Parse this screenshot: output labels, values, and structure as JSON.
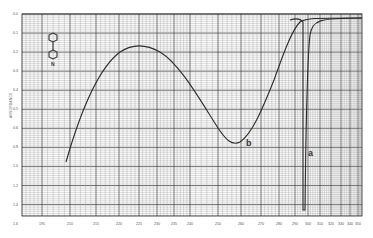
{
  "chart_data": {
    "type": "line",
    "title": "",
    "xlabel": "",
    "ylabel": "ABSORBANCE",
    "x_ticks": [
      "195",
      "210",
      "215",
      "220",
      "225",
      "230",
      "235",
      "240",
      "250",
      "260",
      "270",
      "280",
      "290",
      "300",
      "310",
      "320",
      "330",
      "340",
      "350"
    ],
    "y_ticks": [
      "0.0",
      "0.1",
      "0.2",
      "0.3",
      "0.4",
      "0.5",
      "0.6",
      "0.8",
      "1.0",
      "1.2",
      "1.4",
      "1.6"
    ],
    "grid": true,
    "legend": null,
    "annotations": [
      "a",
      "b"
    ],
    "structure_label": "N",
    "series": [
      {
        "name": "b",
        "points": [
          {
            "x": 215,
            "y": 1.3
          },
          {
            "x": 225,
            "y": 0.55
          },
          {
            "x": 235,
            "y": 0.3
          },
          {
            "x": 250,
            "y": 0.45
          },
          {
            "x": 270,
            "y": 1.1
          },
          {
            "x": 285,
            "y": 0.5
          },
          {
            "x": 300,
            "y": 0.05
          },
          {
            "x": 350,
            "y": 0.03
          }
        ]
      },
      {
        "name": "a",
        "points": [
          {
            "x": 290,
            "y": 0.05
          },
          {
            "x": 300,
            "y": 1.6
          },
          {
            "x": 305,
            "y": 0.1
          },
          {
            "x": 320,
            "y": 0.03
          },
          {
            "x": 350,
            "y": 0.03
          }
        ]
      }
    ]
  },
  "axes": {
    "ylabel": "ABSORBANCE"
  },
  "annotations": {
    "curve_a": "a",
    "curve_b": "b",
    "structure_atom": "N"
  }
}
